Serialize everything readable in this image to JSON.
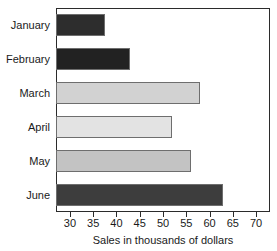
{
  "chart_data": {
    "type": "bar",
    "orientation": "horizontal",
    "title": "",
    "xlabel": "Sales in thousands of dollars",
    "ylabel": "",
    "categories": [
      "January",
      "February",
      "March",
      "April",
      "May",
      "June"
    ],
    "values": [
      37.5,
      43,
      58,
      52,
      56,
      63
    ],
    "series": [
      {
        "name": "Sales",
        "values": [
          37.5,
          43,
          58,
          52,
          56,
          63
        ]
      }
    ],
    "xlim": [
      27,
      73
    ],
    "xticks": [
      30,
      35,
      40,
      45,
      50,
      55,
      60,
      65,
      70
    ],
    "xtick_labels": [
      "30",
      "35",
      "40",
      "45",
      "50",
      "55",
      "60",
      "65",
      "70"
    ],
    "grid": false,
    "legend": false,
    "bar_colors": [
      "#2d2d2d",
      "#222222",
      "#d2d2d2",
      "#e3e3e3",
      "#c3c3c3",
      "#3d3d3d"
    ],
    "bar_edge_color": "#6e6e6e",
    "axis_color": "#2b2b2b",
    "background_color": "#ffffff",
    "text_color": "#1a1a1a"
  }
}
